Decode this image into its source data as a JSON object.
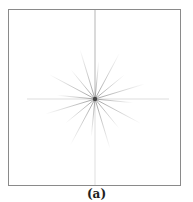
{
  "figure": {
    "caption": "(a)",
    "center": {
      "x": 86,
      "y": 89
    },
    "rays": {
      "count": 16,
      "stroke_color": "#9a9a9a",
      "core_color": "#444444"
    },
    "axes": {
      "vertical_color": "#b5b5b5",
      "horizontal_color": "#d4d4d4"
    },
    "border_color": "#8a8a8a"
  }
}
